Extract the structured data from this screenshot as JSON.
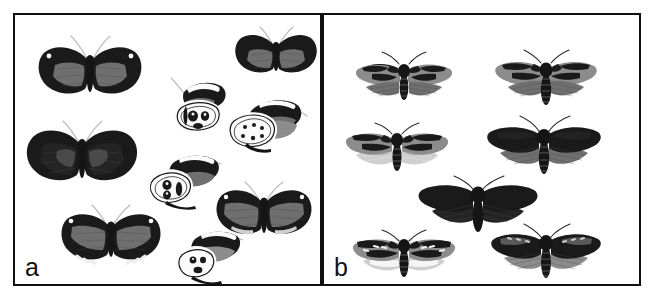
{
  "figure": {
    "type": "two-panel comparative plate of pinned lepidoptera specimens",
    "background_color": "#ffffff",
    "frame_color": "#101010",
    "width": 654,
    "height": 305
  },
  "panels": [
    {
      "id": "a",
      "label": "a",
      "subject": "butterflies",
      "description": "Nine pinned butterfly specimens on a white background: six shown dorsal (wings spread) and three shown in lateral view with ringed eyespots on the underside.",
      "specimen_count": 9,
      "colors": {
        "wing_dark": "#1f1f1f",
        "wing_band": "#7d7d7d",
        "spot_white": "#f7f7f7",
        "antenna": "#bdbdbd"
      },
      "specimens": [
        {
          "name": "butterfly-dorsal-top-left",
          "view": "dorsal",
          "pattern": "dark wings with broad grey median band and small white apical dots"
        },
        {
          "name": "butterfly-dorsal-top-right",
          "view": "dorsal",
          "pattern": "dark wings with short grey median patches"
        },
        {
          "name": "butterfly-lateral-upper",
          "view": "lateral",
          "pattern": "underside with concentric ringed ocelli"
        },
        {
          "name": "butterfly-dorsal-mid-left",
          "view": "dorsal",
          "pattern": "uniformly dark brown-black wings, faint grey shading"
        },
        {
          "name": "butterfly-lateral-right",
          "view": "lateral",
          "pattern": "underside with large ringed ocellus and grey hindwing"
        },
        {
          "name": "butterfly-lateral-middle",
          "view": "lateral",
          "pattern": "underside with double ringed ocelli and pale banding"
        },
        {
          "name": "butterfly-dorsal-right",
          "view": "dorsal",
          "pattern": "dark wings, wide grey band, white apical dots and pale marginal lunules"
        },
        {
          "name": "butterfly-dorsal-bottom-left",
          "view": "dorsal",
          "pattern": "dark wings, grey band, white apical dots and white marginal spots"
        },
        {
          "name": "butterfly-lateral-bottom",
          "view": "lateral",
          "pattern": "underside with ringed ocelli and grey-banded forewing"
        }
      ]
    },
    {
      "id": "b",
      "label": "b",
      "subject": "moths",
      "description": "Seven pinned noctuid moth specimens on a white background, all in dorsal view with wings spread; forewings mottled black and grey, hindwings ranging from pale cream to sooty black.",
      "specimen_count": 7,
      "colors": {
        "forewing_dark": "#232323",
        "forewing_mottle": "#8a8a8a",
        "hindwing_pale": "#d8d8d8",
        "hindwing_dark": "#3a3a3a",
        "body": "#1b1b1b"
      },
      "specimens": [
        {
          "name": "moth-top-left",
          "view": "dorsal",
          "pattern": "mottled grey-black forewings, mid-grey hindwings"
        },
        {
          "name": "moth-top-right",
          "view": "dorsal",
          "pattern": "mottled grey-black forewings, mid-grey hindwings, stout abdomen"
        },
        {
          "name": "moth-mid-left",
          "view": "dorsal",
          "pattern": "mottled forewings with very pale cream hindwings"
        },
        {
          "name": "moth-mid-right",
          "view": "dorsal",
          "pattern": "very dark forewings with grey hindwings"
        },
        {
          "name": "moth-centre",
          "view": "dorsal",
          "pattern": "melanic, almost uniformly black forewings and hindwings"
        },
        {
          "name": "moth-bottom-left",
          "view": "dorsal",
          "pattern": "contrasting black-and-white mottled forewings with pale cream hindwings"
        },
        {
          "name": "moth-bottom-right",
          "view": "dorsal",
          "pattern": "dark mottled forewings with grey veined hindwings"
        }
      ]
    }
  ]
}
